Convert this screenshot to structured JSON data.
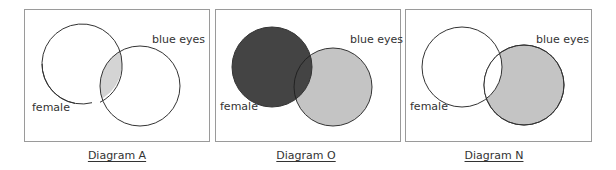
{
  "colors": {
    "frame": "#9a9a9a",
    "stroke": "#333333",
    "dark_fill": "#444444",
    "light_fill": "#c4c4c4",
    "overlap_light": "#d4d4d4"
  },
  "diagrams": [
    {
      "id": "A",
      "caption": "Diagram A",
      "set_labels": {
        "female": "female",
        "blue_eyes": "blue eyes"
      },
      "shaded_region": "female AND blue eyes"
    },
    {
      "id": "O",
      "caption": "Diagram O",
      "set_labels": {
        "female": "female",
        "blue_eyes": "blue eyes"
      },
      "shaded_region": "female OR blue eyes"
    },
    {
      "id": "N",
      "caption": "Diagram N",
      "set_labels": {
        "female": "female",
        "blue_eyes": "blue eyes"
      },
      "shaded_region": "blue eyes NOT female"
    }
  ]
}
